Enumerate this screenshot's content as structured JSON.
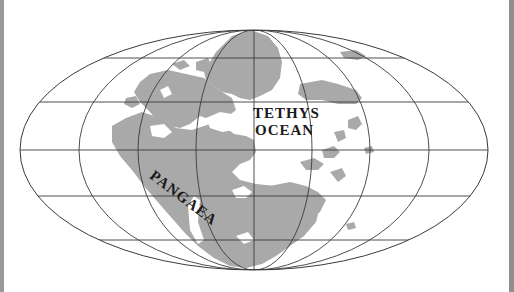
{
  "map": {
    "projection": "Mollweide-like elliptical world projection",
    "labels": {
      "ocean_line1": "TETHYS",
      "ocean_line2": "OCEAN",
      "continent": "PANGAEA"
    },
    "colors": {
      "land": "#a9a9a9",
      "ocean": "#ffffff",
      "graticule": "#3a3a3a",
      "frame_border": "#9a9a9a"
    }
  }
}
